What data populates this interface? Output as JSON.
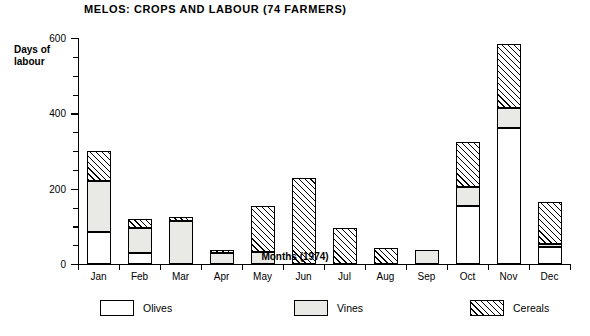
{
  "chart_data": {
    "type": "bar",
    "stacked": true,
    "title": "MELOS:  CROPS AND LABOUR (74 FARMERS)",
    "xlabel": "Months (1974)",
    "ylabel": "Days of\nlabour",
    "ylabel_line1": "Days of",
    "ylabel_line2": "labour",
    "categories": [
      "Jan",
      "Feb",
      "Mar",
      "Apr",
      "May",
      "Jun",
      "Jul",
      "Aug",
      "Sep",
      "Oct",
      "Nov",
      "Dec"
    ],
    "series": [
      {
        "name": "Olives",
        "values": [
          85,
          30,
          0,
          0,
          0,
          0,
          0,
          0,
          0,
          155,
          360,
          45
        ]
      },
      {
        "name": "Vines",
        "values": [
          135,
          65,
          115,
          28,
          32,
          0,
          0,
          0,
          38,
          50,
          55,
          7
        ]
      },
      {
        "name": "Cereals",
        "values": [
          80,
          25,
          10,
          10,
          122,
          228,
          95,
          42,
          0,
          120,
          170,
          113
        ]
      }
    ],
    "totals": [
      300,
      120,
      125,
      38,
      154,
      228,
      95,
      42,
      38,
      325,
      585,
      165
    ],
    "ylim": [
      0,
      600
    ],
    "ytick_major": [
      0,
      200,
      400,
      600
    ],
    "ytick_minor_step": 50,
    "grid": false,
    "legend_position": "bottom",
    "legend": [
      {
        "label": "Olives",
        "pattern": "solid-white"
      },
      {
        "label": "Vines",
        "pattern": "dotted"
      },
      {
        "label": "Cereals",
        "pattern": "diagonal-hatch"
      }
    ]
  }
}
